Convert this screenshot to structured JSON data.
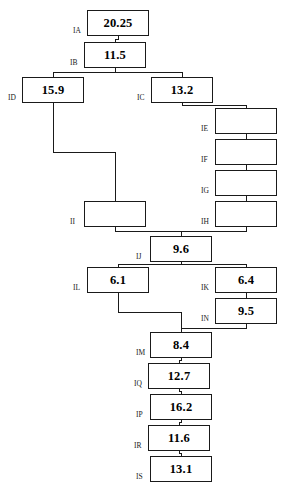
{
  "diagram": {
    "type": "tree",
    "background_color": "#ffffff",
    "box_border_color": "#1a1a1a",
    "connector_color": "#1a1a1a",
    "nodes": [
      {
        "id": "IA",
        "label": "IA",
        "value": "20.25",
        "x": 87,
        "y": 10,
        "w": 62,
        "h": 26
      },
      {
        "id": "IB",
        "label": "IB",
        "value": "11.5",
        "x": 84,
        "y": 42,
        "w": 62,
        "h": 26
      },
      {
        "id": "ID",
        "label": "ID",
        "value": "15.9",
        "x": 22,
        "y": 77,
        "w": 62,
        "h": 26
      },
      {
        "id": "IC",
        "label": "IC",
        "value": "13.2",
        "x": 151,
        "y": 77,
        "w": 62,
        "h": 26
      },
      {
        "id": "IE",
        "label": "IE",
        "value": "",
        "x": 215,
        "y": 108,
        "w": 62,
        "h": 26
      },
      {
        "id": "IF",
        "label": "IF",
        "value": "",
        "x": 215,
        "y": 139,
        "w": 62,
        "h": 26
      },
      {
        "id": "IG",
        "label": "IG",
        "value": "",
        "x": 215,
        "y": 170,
        "w": 62,
        "h": 26
      },
      {
        "id": "IH",
        "label": "IH",
        "value": "",
        "x": 215,
        "y": 201,
        "w": 62,
        "h": 26
      },
      {
        "id": "II",
        "label": "II",
        "value": "",
        "x": 84,
        "y": 201,
        "w": 62,
        "h": 26
      },
      {
        "id": "IJ",
        "label": "IJ",
        "value": "9.6",
        "x": 150,
        "y": 236,
        "w": 62,
        "h": 26
      },
      {
        "id": "IL",
        "label": "IL",
        "value": "6.1",
        "x": 87,
        "y": 267,
        "w": 62,
        "h": 26
      },
      {
        "id": "IK",
        "label": "IK",
        "value": "6.4",
        "x": 215,
        "y": 267,
        "w": 62,
        "h": 26
      },
      {
        "id": "IN",
        "label": "IN",
        "value": "9.5",
        "x": 215,
        "y": 298,
        "w": 62,
        "h": 26
      },
      {
        "id": "IM",
        "label": "IM",
        "value": "8.4",
        "x": 150,
        "y": 332,
        "w": 62,
        "h": 26
      },
      {
        "id": "IQ",
        "label": "IQ",
        "value": "12.7",
        "x": 148,
        "y": 363,
        "w": 62,
        "h": 26
      },
      {
        "id": "IP",
        "label": "IP",
        "value": "16.2",
        "x": 150,
        "y": 394,
        "w": 62,
        "h": 26
      },
      {
        "id": "IR",
        "label": "IR",
        "value": "11.6",
        "x": 148,
        "y": 425,
        "w": 62,
        "h": 26
      },
      {
        "id": "IS",
        "label": "IS",
        "value": "13.1",
        "x": 150,
        "y": 456,
        "w": 62,
        "h": 26
      }
    ],
    "edges": [
      {
        "from": "IA",
        "to": "IB"
      },
      {
        "from": "IB",
        "to": "ID"
      },
      {
        "from": "IB",
        "to": "IC"
      },
      {
        "from": "IC",
        "to": "IE"
      },
      {
        "from": "IE",
        "to": "IF"
      },
      {
        "from": "IF",
        "to": "IG"
      },
      {
        "from": "IG",
        "to": "IH"
      },
      {
        "from": "ID",
        "to": "II"
      },
      {
        "from": "II",
        "to": "IJ"
      },
      {
        "from": "IH",
        "to": "IJ"
      },
      {
        "from": "IJ",
        "to": "IL"
      },
      {
        "from": "IJ",
        "to": "IK"
      },
      {
        "from": "IK",
        "to": "IN"
      },
      {
        "from": "IL",
        "to": "IM"
      },
      {
        "from": "IN",
        "to": "IM"
      },
      {
        "from": "IM",
        "to": "IQ"
      },
      {
        "from": "IQ",
        "to": "IP"
      },
      {
        "from": "IP",
        "to": "IR"
      },
      {
        "from": "IR",
        "to": "IS"
      }
    ]
  }
}
